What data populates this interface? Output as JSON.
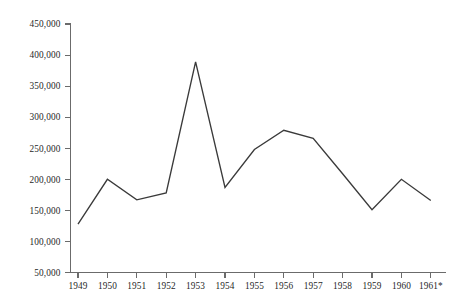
{
  "chart_data": {
    "type": "line",
    "title": "",
    "subtitle": "",
    "xlabel": "",
    "ylabel": "",
    "categories": [
      "1949",
      "1950",
      "1951",
      "1952",
      "1953",
      "1954",
      "1955",
      "1956",
      "1957",
      "1958",
      "1959",
      "1960",
      "1961*"
    ],
    "values": [
      128000,
      200000,
      167000,
      178000,
      389000,
      187000,
      248000,
      279000,
      266000,
      209000,
      151000,
      200000,
      166000
    ],
    "series": [
      {
        "name": "",
        "values": [
          128000,
          200000,
          167000,
          178000,
          389000,
          187000,
          248000,
          279000,
          266000,
          209000,
          151000,
          200000,
          166000
        ]
      }
    ],
    "ylim": [
      50000,
      450000
    ],
    "ytick_values": [
      50000,
      100000,
      150000,
      200000,
      250000,
      300000,
      350000,
      400000,
      450000
    ],
    "ytick_labels": [
      "50,000",
      "100,000",
      "150,000",
      "200,000",
      "250,000",
      "300,000",
      "350,000",
      "400,000",
      "450,000"
    ],
    "xtick_labels": [
      "1949",
      "1950",
      "1951",
      "1952",
      "1953",
      "1954",
      "1955",
      "1956",
      "1957",
      "1958",
      "1959",
      "1960",
      "1961*"
    ],
    "grid": false,
    "legend": null,
    "legend_position": "none",
    "line_color": "#3a3a3a",
    "axis_color": "#6b6b6b",
    "background_color": "#ffffff",
    "annotations": [
      "* asterisk on final x-axis label 1961*"
    ]
  }
}
